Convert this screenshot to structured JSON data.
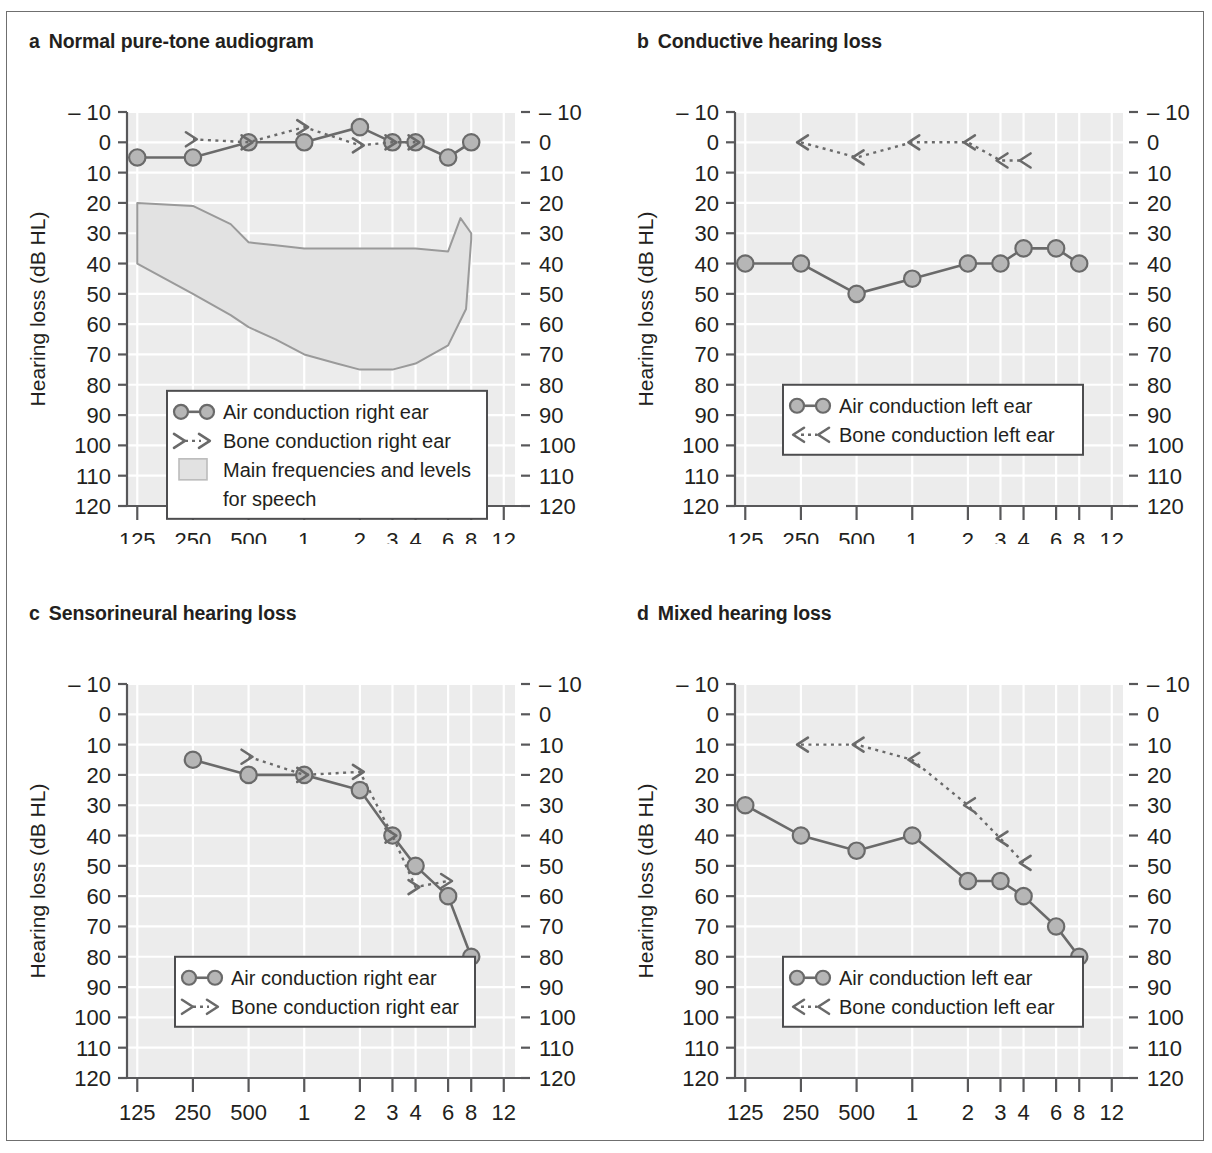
{
  "figure": {
    "axis_y_label": "Hearing loss (dB HL)",
    "axis_x_label_left": "Frequency (Hz)",
    "axis_x_label_right": "Frequency (kHz)",
    "y_ticks": [
      "– 10",
      "0",
      "10",
      "20",
      "30",
      "40",
      "50",
      "60",
      "70",
      "80",
      "90",
      "100",
      "110",
      "120"
    ],
    "y_values": [
      -10,
      0,
      10,
      20,
      30,
      40,
      50,
      60,
      70,
      80,
      90,
      100,
      110,
      120
    ],
    "x_ticks": [
      "125",
      "250",
      "500",
      "1",
      "2",
      "3",
      "4",
      "6",
      "8",
      "12"
    ],
    "x_values_hz": [
      125,
      250,
      500,
      1000,
      2000,
      3000,
      4000,
      6000,
      8000,
      12000
    ],
    "colors": {
      "plot_background": "#ececec",
      "gridline": "#ffffff",
      "marker_fill": "#b6b6b6",
      "marker_stroke": "#6a6a6a",
      "line": "#6a6a6a",
      "speech_band_fill": "#e2e2e2",
      "speech_band_stroke": "#9a9a9a",
      "frame": "#6f6f6f",
      "text": "#231f20"
    }
  },
  "panels": [
    {
      "letter": "a",
      "title": "Normal pure-tone audiogram",
      "legend": [
        {
          "symbol": "air-right",
          "label": "Air conduction right ear"
        },
        {
          "symbol": "bone-right",
          "label": "Bone conduction right ear"
        },
        {
          "symbol": "speech-band",
          "label": "Main frequencies and levels"
        },
        {
          "symbol": "speech-band-cont",
          "label": "for speech"
        }
      ],
      "has_speech_band": true
    },
    {
      "letter": "b",
      "title": "Conductive hearing loss",
      "legend": [
        {
          "symbol": "air-left",
          "label": "Air conduction left ear"
        },
        {
          "symbol": "bone-left",
          "label": "Bone conduction left ear"
        }
      ],
      "has_speech_band": false
    },
    {
      "letter": "c",
      "title": "Sensorineural hearing loss",
      "legend": [
        {
          "symbol": "air-right",
          "label": "Air conduction right ear"
        },
        {
          "symbol": "bone-right",
          "label": "Bone conduction right ear"
        }
      ],
      "has_speech_band": false
    },
    {
      "letter": "d",
      "title": "Mixed hearing loss",
      "legend": [
        {
          "symbol": "air-left",
          "label": "Air conduction left ear"
        },
        {
          "symbol": "bone-left",
          "label": "Bone conduction left ear"
        }
      ],
      "has_speech_band": false
    }
  ],
  "chart_data": [
    {
      "type": "line",
      "panel": "a",
      "title": "Normal pure-tone audiogram",
      "xlabel": "Frequency (Hz) / Frequency (kHz)",
      "ylabel": "Hearing loss (dB HL)",
      "xscale": "log",
      "x_ticks_hz": [
        125,
        250,
        500,
        1000,
        2000,
        3000,
        4000,
        6000,
        8000,
        12000
      ],
      "x_tick_labels": [
        "125",
        "250",
        "500",
        "1",
        "2",
        "3",
        "4",
        "6",
        "8",
        "12"
      ],
      "ylim": [
        -10,
        120
      ],
      "y_inverted": true,
      "grid": true,
      "legend_position": "lower-center",
      "series": [
        {
          "name": "Air conduction right ear",
          "marker": "circle",
          "linestyle": "solid",
          "x_hz": [
            125,
            250,
            500,
            1000,
            2000,
            3000,
            4000,
            6000,
            8000
          ],
          "values": [
            5,
            5,
            0,
            0,
            -5,
            0,
            0,
            5,
            0
          ]
        },
        {
          "name": "Bone conduction right ear",
          "marker": "bone-right-bracket",
          "linestyle": "dotted",
          "x_hz": [
            250,
            500,
            1000,
            2000,
            3000,
            4000
          ],
          "values": [
            -1,
            0,
            -5,
            1,
            0,
            0
          ]
        }
      ],
      "shaded_region": {
        "name": "Main frequencies and levels for speech",
        "upper_x_hz": [
          125,
          250,
          400,
          500,
          700,
          1000,
          2000,
          3000,
          4000,
          6000,
          7000,
          8000
        ],
        "upper_values": [
          20,
          21,
          27,
          33,
          34,
          35,
          35,
          35,
          35,
          36,
          25,
          30
        ],
        "lower_x_hz": [
          125,
          250,
          400,
          500,
          700,
          1000,
          1500,
          2000,
          3000,
          4000,
          6000,
          7500,
          8000
        ],
        "lower_values": [
          40,
          50,
          57,
          61,
          65,
          70,
          73,
          75,
          75,
          73,
          67,
          55,
          32
        ]
      }
    },
    {
      "type": "line",
      "panel": "b",
      "title": "Conductive hearing loss",
      "xlabel": "Frequency (Hz) / Frequency (kHz)",
      "ylabel": "Hearing loss (dB HL)",
      "xscale": "log",
      "x_ticks_hz": [
        125,
        250,
        500,
        1000,
        2000,
        3000,
        4000,
        6000,
        8000,
        12000
      ],
      "x_tick_labels": [
        "125",
        "250",
        "500",
        "1",
        "2",
        "3",
        "4",
        "6",
        "8",
        "12"
      ],
      "ylim": [
        -10,
        120
      ],
      "y_inverted": true,
      "grid": true,
      "legend_position": "lower-center",
      "series": [
        {
          "name": "Air conduction left ear",
          "marker": "circle",
          "linestyle": "solid",
          "x_hz": [
            125,
            250,
            500,
            1000,
            2000,
            3000,
            4000,
            6000,
            8000
          ],
          "values": [
            40,
            40,
            50,
            45,
            40,
            40,
            35,
            35,
            40
          ]
        },
        {
          "name": "Bone conduction left ear",
          "marker": "bone-left-bracket",
          "linestyle": "dotted",
          "x_hz": [
            250,
            500,
            1000,
            2000,
            3000,
            4000
          ],
          "values": [
            0,
            5,
            0,
            0,
            6,
            6
          ]
        }
      ]
    },
    {
      "type": "line",
      "panel": "c",
      "title": "Sensorineural hearing loss",
      "xlabel": "Frequency (Hz) / Frequency (kHz)",
      "ylabel": "Hearing loss (dB HL)",
      "xscale": "log",
      "x_ticks_hz": [
        125,
        250,
        500,
        1000,
        2000,
        3000,
        4000,
        6000,
        8000,
        12000
      ],
      "x_tick_labels": [
        "125",
        "250",
        "500",
        "1",
        "2",
        "3",
        "4",
        "6",
        "8",
        "12"
      ],
      "ylim": [
        -10,
        120
      ],
      "y_inverted": true,
      "grid": true,
      "legend_position": "lower-center",
      "series": [
        {
          "name": "Air conduction right ear",
          "marker": "circle",
          "linestyle": "solid",
          "x_hz": [
            250,
            500,
            1000,
            2000,
            3000,
            4000,
            6000,
            8000
          ],
          "values": [
            15,
            20,
            20,
            25,
            40,
            50,
            60,
            80
          ]
        },
        {
          "name": "Bone conduction right ear",
          "marker": "bone-right-bracket",
          "linestyle": "dotted",
          "x_hz": [
            500,
            1000,
            2000,
            3000,
            4000,
            6000
          ],
          "values": [
            14,
            20,
            19,
            40,
            57,
            55
          ]
        }
      ]
    },
    {
      "type": "line",
      "panel": "d",
      "title": "Mixed hearing loss",
      "xlabel": "Frequency (Hz) / Frequency (kHz)",
      "ylabel": "Hearing loss (dB HL)",
      "xscale": "log",
      "x_ticks_hz": [
        125,
        250,
        500,
        1000,
        2000,
        3000,
        4000,
        6000,
        8000,
        12000
      ],
      "x_tick_labels": [
        "125",
        "250",
        "500",
        "1",
        "2",
        "3",
        "4",
        "6",
        "8",
        "12"
      ],
      "ylim": [
        -10,
        120
      ],
      "y_inverted": true,
      "grid": true,
      "legend_position": "lower-center",
      "series": [
        {
          "name": "Air conduction left ear",
          "marker": "circle",
          "linestyle": "solid",
          "x_hz": [
            125,
            250,
            500,
            1000,
            2000,
            3000,
            4000,
            6000,
            8000
          ],
          "values": [
            30,
            40,
            45,
            40,
            55,
            55,
            60,
            70,
            80
          ]
        },
        {
          "name": "Bone conduction left ear",
          "marker": "bone-left-bracket",
          "linestyle": "dotted",
          "x_hz": [
            250,
            500,
            1000,
            2000,
            3000,
            4000
          ],
          "values": [
            10,
            10,
            15,
            30,
            41,
            49
          ]
        }
      ]
    }
  ]
}
